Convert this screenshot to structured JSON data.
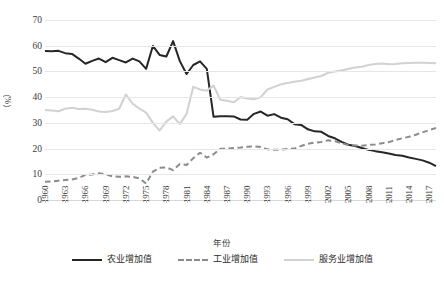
{
  "chart_data": {
    "type": "line",
    "title": "",
    "xlabel": "年份",
    "ylabel": "（%）",
    "ylim": [
      0,
      70
    ],
    "ytick_values": [
      0,
      10,
      20,
      30,
      40,
      50,
      60,
      70
    ],
    "ytick_labels": [
      "0",
      "10",
      "20",
      "30",
      "40",
      "50",
      "60",
      "70"
    ],
    "xlim": [
      1960,
      2018
    ],
    "xtick_labels": [
      "1960",
      "1963",
      "1966",
      "1969",
      "1972",
      "1975",
      "1978",
      "1981",
      "1984",
      "1987",
      "1990",
      "1993",
      "1996",
      "1999",
      "2002",
      "2005",
      "2008",
      "2011",
      "2014",
      "2017"
    ],
    "grid": "horizontal",
    "legend_position": "bottom",
    "x": [
      1960,
      1961,
      1962,
      1963,
      1964,
      1965,
      1966,
      1967,
      1968,
      1969,
      1970,
      1971,
      1972,
      1973,
      1974,
      1975,
      1976,
      1977,
      1978,
      1979,
      1980,
      1981,
      1982,
      1983,
      1984,
      1985,
      1986,
      1987,
      1988,
      1989,
      1990,
      1991,
      1992,
      1993,
      1994,
      1995,
      1996,
      1997,
      1998,
      1999,
      2000,
      2001,
      2002,
      2003,
      2004,
      2005,
      2006,
      2007,
      2008,
      2009,
      2010,
      2011,
      2012,
      2013,
      2014,
      2015,
      2016,
      2017,
      2018
    ],
    "series": [
      {
        "name": "农业增加值",
        "style": "solid",
        "color": "#262626",
        "values": [
          57.9,
          57.8,
          58.0,
          57.1,
          56.8,
          55.0,
          53.0,
          54.1,
          55.0,
          53.6,
          55.3,
          54.4,
          53.5,
          55.0,
          53.9,
          51.0,
          59.9,
          56.4,
          55.8,
          61.8,
          54.0,
          49.0,
          52.5,
          53.9,
          51.0,
          32.4,
          32.6,
          32.6,
          32.5,
          31.3,
          31.2,
          33.5,
          34.4,
          32.8,
          33.4,
          32.0,
          31.4,
          29.5,
          29.2,
          27.5,
          26.7,
          26.5,
          24.9,
          24.0,
          22.6,
          21.5,
          21.0,
          20.2,
          19.5,
          19.0,
          18.6,
          18.1,
          17.5,
          17.2,
          16.5,
          16.0,
          15.4,
          14.5,
          13.2
        ]
      },
      {
        "name": "工业增加值",
        "style": "dashed",
        "color": "#8c8c8c",
        "values": [
          7.1,
          7.2,
          7.5,
          7.8,
          8.0,
          8.6,
          9.8,
          9.9,
          10.4,
          10.0,
          9.2,
          9.0,
          9.2,
          9.0,
          8.4,
          6.4,
          11.0,
          12.5,
          12.7,
          11.6,
          14.0,
          13.6,
          16.3,
          18.4,
          16.5,
          17.8,
          19.9,
          20.0,
          20.2,
          20.4,
          20.7,
          20.8,
          20.6,
          19.7,
          19.5,
          19.6,
          19.8,
          20.0,
          21.0,
          21.9,
          22.3,
          22.6,
          23.2,
          22.9,
          22.0,
          21.4,
          21.2,
          21.1,
          21.4,
          21.6,
          22.1,
          22.5,
          23.3,
          24.0,
          24.6,
          25.4,
          26.3,
          27.2,
          28.0
        ]
      },
      {
        "name": "服务业增加值",
        "style": "solid",
        "color": "#d2d2d2",
        "values": [
          35.0,
          34.8,
          34.5,
          35.5,
          35.9,
          35.4,
          35.5,
          35.1,
          34.4,
          34.2,
          34.6,
          35.5,
          41.0,
          37.5,
          35.5,
          34.0,
          30.0,
          27.0,
          30.5,
          32.5,
          29.5,
          33.5,
          44.0,
          43.0,
          42.5,
          44.5,
          39.0,
          38.6,
          38.0,
          40.0,
          39.5,
          39.2,
          40.0,
          43.0,
          44.0,
          45.0,
          45.5,
          46.0,
          46.4,
          47.0,
          47.6,
          48.2,
          49.5,
          50.0,
          50.4,
          51.0,
          51.5,
          51.8,
          52.5,
          52.9,
          53.1,
          52.8,
          52.9,
          53.2,
          53.3,
          53.4,
          53.4,
          53.3,
          53.2
        ]
      }
    ]
  },
  "legend": {
    "items": [
      {
        "label": "农业增加值",
        "swatch": "solid-dark"
      },
      {
        "label": "工业增加值",
        "swatch": "dashed"
      },
      {
        "label": "服务业增加值",
        "swatch": "solid-light"
      }
    ]
  }
}
